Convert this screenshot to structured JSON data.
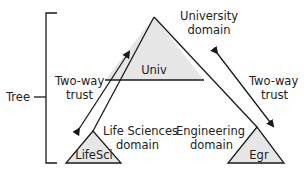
{
  "diagram": {
    "tree_label": "Tree",
    "root_domain": {
      "label_line1": "University",
      "label_line2": "domain",
      "abbr": "Univ"
    },
    "child_domains": [
      {
        "label_line1": "Life Sciences",
        "label_line2": "domain",
        "abbr": "LifeSci"
      },
      {
        "label_line1": "Engineering",
        "label_line2": "domain",
        "abbr": "Egr"
      }
    ],
    "trusts": [
      {
        "label_line1": "Two-way",
        "label_line2": "trust",
        "between": [
          "Univ",
          "LifeSci"
        ]
      },
      {
        "label_line1": "Two-way",
        "label_line2": "trust",
        "between": [
          "Univ",
          "Egr"
        ]
      }
    ],
    "colors": {
      "line": "#1a1a1a",
      "triangle_fill": "#e6e6e6",
      "text": "#222222"
    }
  }
}
